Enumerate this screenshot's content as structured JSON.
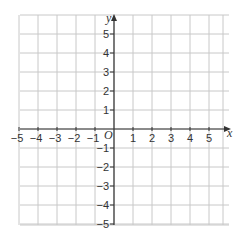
{
  "figure": {
    "type": "cartesian-grid",
    "x_axis": {
      "label": "x",
      "ticks": [
        "−5",
        "−4",
        "−3",
        "−2",
        "−1",
        "1",
        "2",
        "3",
        "4",
        "5"
      ],
      "range": [
        -5,
        5
      ]
    },
    "y_axis": {
      "label": "y",
      "ticks": [
        "5",
        "4",
        "3",
        "2",
        "1",
        "−1",
        "−2",
        "−3",
        "−4",
        "−5"
      ],
      "range": [
        -5,
        5
      ]
    },
    "origin_label": "O",
    "colors": {
      "grid": "#c8c8c8",
      "axis": "#333333",
      "background": "#ffffff"
    }
  }
}
